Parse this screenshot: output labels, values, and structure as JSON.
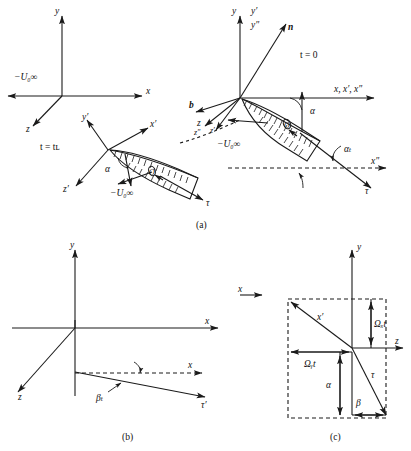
{
  "figure": {
    "panels": [
      {
        "id": "a",
        "caption": "(a)"
      },
      {
        "id": "b",
        "caption": "(b)"
      },
      {
        "id": "c",
        "caption": "(c)"
      }
    ],
    "colors": {
      "stroke": "#1a1a1a",
      "background": "#ffffff",
      "text": "#111111"
    }
  },
  "panel_a": {
    "frame_inertial": {
      "axis_y": "y",
      "axis_x": "x",
      "axis_z": "z",
      "velocity": "−U₀∞"
    },
    "frame_t0": {
      "time_label": "t = 0",
      "axis_y": "y",
      "axis_yp": "y′",
      "axis_ypp": "y″",
      "axis_x_group": "x, x′, x″",
      "axis_z": "z",
      "axis_zpp": "z″",
      "axis_zp": "z′",
      "normal": "n",
      "binormal": "b",
      "velocity": "−U₀∞",
      "angle_alpha": "α",
      "angle_alpha_t": "αₜ",
      "tangent": "τ",
      "axis_xpp_dashed": "x″",
      "wing_point": "O"
    },
    "frame_tL": {
      "time_label": "t = tʟ",
      "axis_yp": "y′",
      "axis_xp": "x′",
      "axis_zp": "z′",
      "velocity": "−U₀∞",
      "angle_alpha": "α",
      "tangent": "τ",
      "wing_point": "O"
    }
  },
  "panel_b": {
    "axis_y": "y",
    "axis_x": "x",
    "axis_z": "z",
    "axis_x_lower": "x",
    "tangent_p": "τ′",
    "angle_beta_t": "βₜ"
  },
  "panel_c": {
    "axis_y": "y",
    "axis_z": "z",
    "axis_x": "x",
    "axis_xp": "x′",
    "omega_x_t": "Ωₓt",
    "omega_y_t": "Ωᵧt",
    "angle_alpha": "α",
    "angle_beta": "β",
    "tangent": "τ"
  }
}
